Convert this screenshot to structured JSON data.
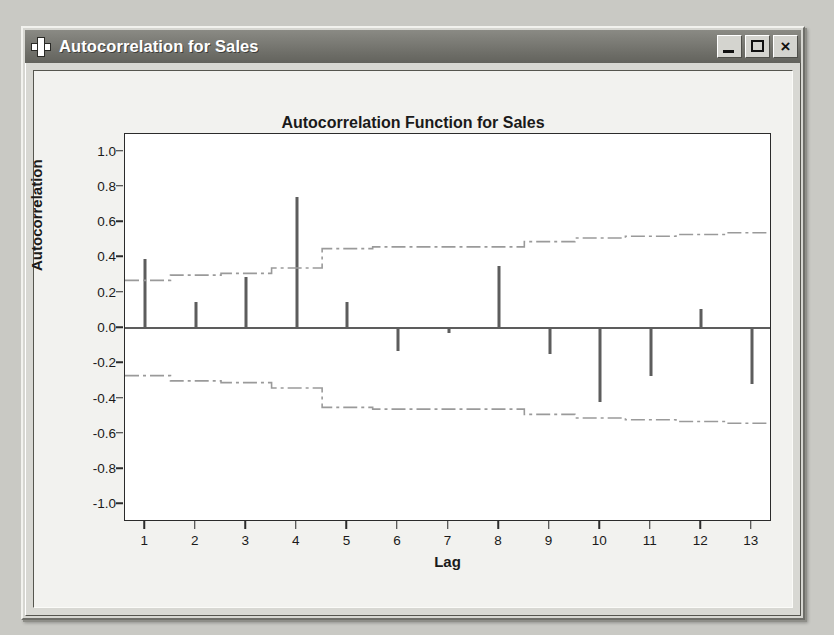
{
  "window": {
    "title": "Autocorrelation for Sales",
    "icon": "plus-icon",
    "buttons": {
      "minimize": "_",
      "maximize": "□",
      "close": "×"
    }
  },
  "chart_data": {
    "type": "bar",
    "title": "Autocorrelation Function for Sales",
    "xlabel": "Lag",
    "ylabel": "Autocorrelation",
    "categories": [
      1,
      2,
      3,
      4,
      5,
      6,
      7,
      8,
      9,
      10,
      11,
      12,
      13
    ],
    "values": [
      0.39,
      0.15,
      0.29,
      0.74,
      0.15,
      -0.13,
      -0.03,
      0.35,
      -0.15,
      -0.42,
      -0.27,
      0.11,
      -0.32
    ],
    "xtick_labels": [
      "1",
      "2",
      "3",
      "4",
      "5",
      "6",
      "7",
      "8",
      "9",
      "10",
      "11",
      "12",
      "13"
    ],
    "ytick_labels": [
      "1.0",
      "0.8",
      "0.6",
      "0.4",
      "0.2",
      "0.0",
      "-0.2",
      "-0.4",
      "-0.6",
      "-0.8",
      "-1.0"
    ],
    "ytick_values": [
      1.0,
      0.8,
      0.6,
      0.4,
      0.2,
      0.0,
      -0.2,
      -0.4,
      -0.6,
      -0.8,
      -1.0
    ],
    "ylim": [
      -1.1,
      1.1
    ],
    "xlim": [
      0.6,
      13.4
    ],
    "grid": false,
    "legend": "none",
    "series": [
      {
        "name": "Autocorrelation",
        "values": [
          0.39,
          0.15,
          0.29,
          0.74,
          0.15,
          -0.13,
          -0.03,
          0.35,
          -0.15,
          -0.42,
          -0.27,
          0.11,
          -0.32
        ]
      },
      {
        "name": "Upper significance limit",
        "values": [
          0.27,
          0.3,
          0.31,
          0.34,
          0.45,
          0.46,
          0.46,
          0.46,
          0.49,
          0.51,
          0.52,
          0.53,
          0.54
        ]
      },
      {
        "name": "Lower significance limit",
        "values": [
          -0.27,
          -0.3,
          -0.31,
          -0.34,
          -0.45,
          -0.46,
          -0.46,
          -0.46,
          -0.49,
          -0.51,
          -0.52,
          -0.53,
          -0.54
        ]
      }
    ],
    "colors": {
      "bar": "#5d5d5d",
      "band": "#9a9a9a",
      "axis": "#2b2b2b",
      "plot_background": "#ffffff"
    }
  }
}
